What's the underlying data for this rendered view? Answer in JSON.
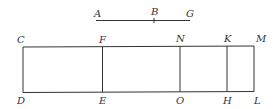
{
  "figure": {
    "segment": {
      "labels": {
        "A": "A",
        "B": "B",
        "G": "G"
      }
    },
    "rectangle": {
      "top_labels": [
        "C",
        "F",
        "N",
        "K",
        "M"
      ],
      "bottom_labels": [
        "D",
        "E",
        "O",
        "H",
        "L"
      ]
    }
  }
}
